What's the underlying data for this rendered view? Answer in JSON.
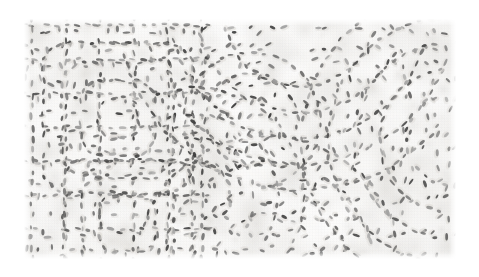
{
  "image": {
    "kind": "photograph",
    "subject": "white quilted embroidered textile close-up",
    "caption": "Macro photograph of a white quilted fabric showing dashed running-stitch lines forming rectilinear grid motifs on the left and curved arc and swirl motifs on the right.",
    "alt_text": "Close-up of white quilted cloth with rows of small dark stitch marks tracing square and curved patterns",
    "width": 479,
    "height": 277
  },
  "page_background": "#ffffff",
  "photo_region": {
    "x": 24,
    "y": 19,
    "width": 432,
    "height": 240,
    "note": "textured fabric area inset within a white page margin"
  },
  "palette": {
    "page": "#ffffff",
    "cloth_light": "#f7f6f4",
    "cloth_mid": "#eceae6",
    "cloth_shadow": "#dcd9d4",
    "stitch_dark": "#3c3c3c",
    "stitch_mid": "#6a6a6a",
    "stitch_light": "#9a9a9a",
    "edge_fade": "#ffffff"
  },
  "texture": {
    "stitch_length_px": 6,
    "stitch_width_px": 2.6,
    "stitch_spacing_px": 11,
    "line_spacing_px": 17,
    "weave_grain_px": 3,
    "vignette_strength": 0.18,
    "blur_px": 0.55
  },
  "motifs": [
    {
      "name": "outer-grid-left",
      "type": "rectilinear-grid",
      "region": [
        24,
        19,
        200,
        240
      ],
      "description": "dashed horizontal and vertical stitch lines forming nested rectangles"
    },
    {
      "name": "nested-square-upper-left",
      "type": "rounded-square",
      "center": [
        118,
        118
      ],
      "sizes": [
        150,
        112,
        74,
        40
      ],
      "corner_radius": 26
    },
    {
      "name": "nested-square-lower-left",
      "type": "rounded-square",
      "center": [
        128,
        224
      ],
      "sizes": [
        128,
        92,
        56
      ],
      "corner_radius": 20
    },
    {
      "name": "arc-fan-upper-right",
      "type": "concentric-arcs",
      "center": [
        300,
        8
      ],
      "radii": [
        78,
        104,
        130,
        156,
        182
      ],
      "start_deg": 20,
      "end_deg": 165
    },
    {
      "name": "arc-fan-right",
      "type": "concentric-arcs",
      "center": [
        452,
        140
      ],
      "radii": [
        46,
        72,
        98,
        124,
        150
      ],
      "start_deg": 100,
      "end_deg": 260
    },
    {
      "name": "arc-fan-lower-center",
      "type": "concentric-arcs",
      "center": [
        268,
        268
      ],
      "radii": [
        54,
        80,
        106,
        132
      ],
      "start_deg": 195,
      "end_deg": 345
    },
    {
      "name": "swirl-center",
      "type": "spiral-cluster",
      "center": [
        252,
        120
      ],
      "radii": [
        24,
        46,
        68
      ],
      "description": "loose swirling stitch paths in the mid field"
    },
    {
      "name": "arc-fan-mid-left",
      "type": "concentric-arcs",
      "center": [
        196,
        196
      ],
      "radii": [
        34,
        58,
        82,
        108
      ],
      "start_deg": 250,
      "end_deg": 390
    }
  ],
  "accessibility": {
    "role": "img",
    "label": "White quilted textile macro photograph"
  }
}
